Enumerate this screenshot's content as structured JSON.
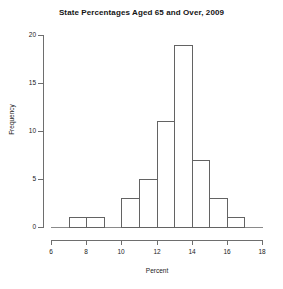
{
  "chart_data": {
    "type": "bar",
    "title": "State Percentages Aged 65 and Over, 2009",
    "xlabel": "Percent",
    "ylabel": "Frequency",
    "xlim": [
      6,
      18
    ],
    "ylim": [
      0,
      20
    ],
    "grid": false,
    "legend": null,
    "bin_width": 1,
    "bins": [
      {
        "lo": 6,
        "hi": 7,
        "label": "6-7",
        "value": 0
      },
      {
        "lo": 7,
        "hi": 8,
        "label": "7-8",
        "value": 1
      },
      {
        "lo": 8,
        "hi": 9,
        "label": "8-9",
        "value": 1
      },
      {
        "lo": 9,
        "hi": 10,
        "label": "9-10",
        "value": 0
      },
      {
        "lo": 10,
        "hi": 11,
        "label": "10-11",
        "value": 3
      },
      {
        "lo": 11,
        "hi": 12,
        "label": "11-12",
        "value": 5
      },
      {
        "lo": 12,
        "hi": 13,
        "label": "12-13",
        "value": 11
      },
      {
        "lo": 13,
        "hi": 14,
        "label": "13-14",
        "value": 19
      },
      {
        "lo": 14,
        "hi": 15,
        "label": "14-15",
        "value": 7
      },
      {
        "lo": 15,
        "hi": 16,
        "label": "15-16",
        "value": 3
      },
      {
        "lo": 16,
        "hi": 17,
        "label": "16-17",
        "value": 1
      },
      {
        "lo": 17,
        "hi": 18,
        "label": "17-18",
        "value": 0
      }
    ],
    "categories": [
      "6-7",
      "7-8",
      "8-9",
      "9-10",
      "10-11",
      "11-12",
      "12-13",
      "13-14",
      "14-15",
      "15-16",
      "16-17",
      "17-18"
    ],
    "values": [
      0,
      1,
      1,
      0,
      3,
      5,
      11,
      19,
      7,
      3,
      1,
      0
    ],
    "x_ticks": [
      6,
      8,
      10,
      12,
      14,
      16,
      18
    ],
    "y_ticks": [
      0,
      5,
      10,
      15,
      20
    ],
    "colors": {
      "background": "#ffffff",
      "bar_edge": "#636363",
      "bar_fill": "transparent",
      "axis": "#6e6e6e",
      "text": "#1a1a1a"
    }
  }
}
